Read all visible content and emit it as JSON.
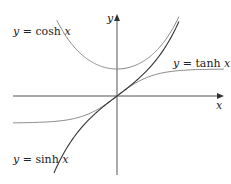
{
  "chart_data": {
    "type": "line",
    "title": "",
    "xlabel": "x",
    "ylabel": "y",
    "grid": false,
    "legend": "inline labels",
    "xlim": [
      -2.9,
      3.0
    ],
    "ylim": [
      -2.9,
      3.0
    ],
    "series": [
      {
        "name": "y = cosh x",
        "function": "cosh",
        "x_range": [
          -1.69,
          1.74
        ],
        "color": "#888888",
        "points": [
          [
            -1.69,
            2.8
          ],
          [
            -1,
            1.54
          ],
          [
            0,
            1.0
          ],
          [
            1,
            1.54
          ],
          [
            1.74,
            2.96
          ]
        ]
      },
      {
        "name": "y = sinh x",
        "function": "sinh",
        "x_range": [
          -1.77,
          1.74
        ],
        "color": "#333333",
        "points": [
          [
            -1.77,
            -2.84
          ],
          [
            -1,
            -1.18
          ],
          [
            0,
            0
          ],
          [
            1,
            1.18
          ],
          [
            1.74,
            2.76
          ]
        ]
      },
      {
        "name": "y = tanh x",
        "function": "tanh",
        "x_range": [
          -2.92,
          3.0
        ],
        "color": "#888888",
        "points": [
          [
            -2.92,
            -0.99
          ],
          [
            -1,
            -0.76
          ],
          [
            0,
            0
          ],
          [
            1,
            0.76
          ],
          [
            3.0,
            0.99
          ]
        ]
      }
    ],
    "annotations": [
      "y = cosh x",
      "y = tanh x",
      "y = sinh x"
    ]
  },
  "labels": {
    "cosh": {
      "lhs": "y",
      "eq": " = cosh ",
      "var": "x"
    },
    "tanh": {
      "lhs": "y",
      "eq": " = tanh ",
      "var": "x"
    },
    "sinh": {
      "lhs": "y",
      "eq": " = sinh ",
      "var": "x"
    },
    "x_axis": "x",
    "y_axis": "y"
  },
  "colors": {
    "axis": "#555555",
    "light_curve": "#8a8a8a",
    "dark_curve": "#333333"
  }
}
